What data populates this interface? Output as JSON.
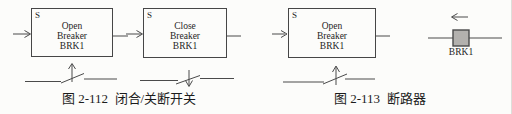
{
  "figure_112": {
    "caption": "图 2-112  闭合/关断开关",
    "open_block": {
      "port": "S",
      "title_lines": [
        "Open",
        "Breaker",
        "BRK1"
      ]
    },
    "close_block": {
      "port": "S",
      "title_lines": [
        "Close",
        "Breaker",
        "BRK1"
      ]
    }
  },
  "figure_113": {
    "caption": "图 2-113  断路器",
    "open_block": {
      "port": "S",
      "title_lines": [
        "Open",
        "Breaker",
        "BRK1"
      ]
    },
    "breaker_symbol_label": "BRK1"
  },
  "colors": {
    "line": "#4a4a4a",
    "text": "#1f1f1f",
    "breaker_square_fill": "#b3b1ae",
    "breaker_square_border": "#4a4a4a",
    "background": "#fcfcfa"
  }
}
